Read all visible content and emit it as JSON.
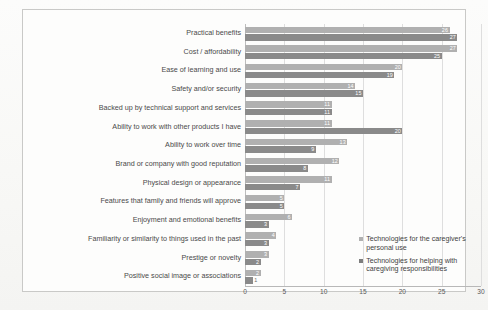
{
  "chart_data": {
    "type": "bar",
    "orientation": "horizontal",
    "title": "",
    "xlabel": "",
    "ylabel": "",
    "xlim": [
      0,
      30
    ],
    "xticks": [
      0,
      5,
      10,
      15,
      20,
      25,
      30
    ],
    "grid": true,
    "legend_position": "inside-right-lower",
    "categories": [
      "Practical benefits",
      "Cost / affordability",
      "Ease of learning and use",
      "Safety and/or security",
      "Backed up by technical support and services",
      "Ability to work with other products I have",
      "Ability to work over time",
      "Brand or company with good reputation",
      "Physical design or appearance",
      "Features that family and friends will approve",
      "Enjoyment and emotional benefits",
      "Familiarity or similarity to things used in the past",
      "Prestige or novelty",
      "Positive social image or associations"
    ],
    "series": [
      {
        "name": "Technologies for the caregiver's personal use",
        "color": "#b0b0b0",
        "values": [
          26,
          27,
          20,
          14,
          11,
          11,
          13,
          12,
          11,
          5,
          6,
          4,
          3,
          2
        ]
      },
      {
        "name": "Technologies for helping with caregiving responsibilities",
        "color": "#8a8a8a",
        "values": [
          27,
          25,
          19,
          15,
          11,
          20,
          9,
          8,
          7,
          5,
          3,
          3,
          2,
          1
        ]
      }
    ]
  },
  "legend": {
    "items": [
      {
        "label": "Technologies for the caregiver's personal use"
      },
      {
        "label": "Technologies for helping with caregiving responsibilities"
      }
    ]
  }
}
